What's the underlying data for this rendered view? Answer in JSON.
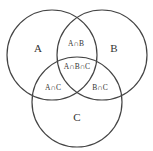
{
  "diagram": {
    "type": "venn",
    "sets": [
      {
        "id": "A",
        "label": "A",
        "cx": 52,
        "cy": 55,
        "r": 45
      },
      {
        "id": "B",
        "label": "B",
        "cx": 102,
        "cy": 55,
        "r": 45
      },
      {
        "id": "C",
        "label": "C",
        "cx": 77,
        "cy": 102,
        "r": 45
      }
    ],
    "regions": {
      "a_only": "A",
      "b_only": "B",
      "c_only": "C",
      "ab": "A∩B",
      "ac": "A∩C",
      "bc": "B∩C",
      "abc": "A∩B∩C"
    },
    "colors": {
      "stroke": "#444444",
      "text": "#333333",
      "background": "#ffffff"
    }
  }
}
